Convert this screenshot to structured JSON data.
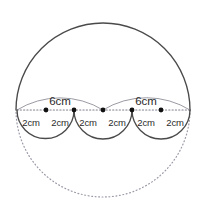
{
  "figure": {
    "width": 207,
    "height": 221,
    "background_color": "#ffffff"
  },
  "colors": {
    "solid_stroke": "#4a4a4a",
    "dotted_stroke": "#9a9aa8",
    "measure_arc_stroke": "#8f8f98",
    "dot_fill": "#111111",
    "text": "#2b2b2b"
  },
  "big_circle": {
    "center_x": 103,
    "center_y": 110,
    "radius": 87,
    "upper_arc_style": "solid",
    "lower_arc_style": "dotted"
  },
  "diameter_line": {
    "y": 110,
    "x_start": 17,
    "x_end": 190,
    "style": "dotted"
  },
  "points": [
    {
      "id": "p1",
      "x": 17,
      "y": 110,
      "marker": false
    },
    {
      "id": "p2",
      "x": 46,
      "y": 110,
      "marker": true
    },
    {
      "id": "p3",
      "x": 74,
      "y": 110,
      "marker": true
    },
    {
      "id": "p4",
      "x": 103,
      "y": 110,
      "marker": true
    },
    {
      "id": "p5",
      "x": 132,
      "y": 110,
      "marker": true
    },
    {
      "id": "p6",
      "x": 161,
      "y": 110,
      "marker": true
    },
    {
      "id": "p7",
      "x": 190,
      "y": 110,
      "marker": false
    }
  ],
  "scallops": [
    {
      "id": "scallop-left",
      "x_start": 17,
      "x_end": 74,
      "direction": "down"
    },
    {
      "id": "scallop-middle",
      "x_start": 74,
      "x_end": 132,
      "direction": "down"
    },
    {
      "id": "scallop-right",
      "x_start": 132,
      "x_end": 190,
      "direction": "down"
    }
  ],
  "labels": {
    "segments_2cm": [
      {
        "id": "seg-1",
        "text": "2cm",
        "x": 31,
        "y": 118
      },
      {
        "id": "seg-2",
        "text": "2cm",
        "x": 60,
        "y": 118
      },
      {
        "id": "seg-3",
        "text": "2cm",
        "x": 88,
        "y": 118
      },
      {
        "id": "seg-4",
        "text": "2cm",
        "x": 117,
        "y": 118
      },
      {
        "id": "seg-5",
        "text": "2cm",
        "x": 146,
        "y": 118
      },
      {
        "id": "seg-6",
        "text": "2cm",
        "x": 175,
        "y": 118
      }
    ],
    "spans_6cm": [
      {
        "id": "span-left",
        "text": "6cm",
        "x": 60,
        "y": 96,
        "arc_x_start": 17,
        "arc_x_end": 103
      },
      {
        "id": "span-right",
        "text": "6cm",
        "x": 146,
        "y": 96,
        "arc_x_start": 103,
        "arc_x_end": 190
      }
    ]
  }
}
